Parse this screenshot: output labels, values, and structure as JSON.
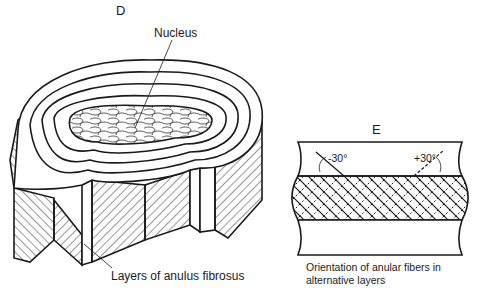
{
  "panel_d": {
    "letter": "D",
    "nucleus_label": "Nucleus",
    "layers_label": "Layers of anulus fibrosus"
  },
  "panel_e": {
    "letter": "E",
    "angle_left": "-30°",
    "angle_right": "+30°",
    "caption_line1": "Orientation of anular fibers in",
    "caption_line2": "alternative layers"
  },
  "colors": {
    "ink": "#1a1a1a",
    "background": "#ffffff"
  }
}
